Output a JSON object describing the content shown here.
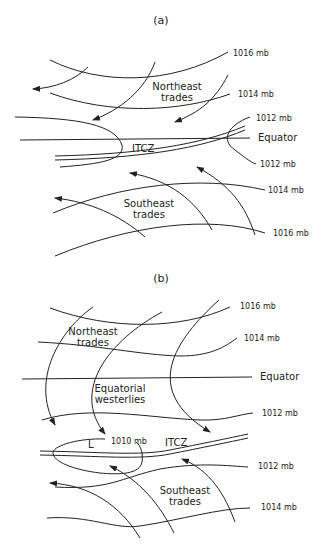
{
  "panel_a": {
    "label": "(a)",
    "isobars": [
      "1016 mb",
      "1014 mb",
      "1012 mb",
      "1012 mb",
      "1014 mb",
      "1016 mb"
    ],
    "equator_label": "Equator",
    "itcz_label": "ITCZ",
    "ne_trades": [
      "Northeast",
      "trades"
    ],
    "se_trades": [
      "Southeast",
      "trades"
    ]
  },
  "panel_b": {
    "label": "(b)",
    "isobars": [
      "1016 mb",
      "1014 mb",
      "1012 mb",
      "1010 mb",
      "1012 mb",
      "1014 mb"
    ],
    "equator_label": "Equator",
    "itcz_label": "ITCZ",
    "low_label": "L",
    "ne_trades": [
      "Northeast",
      "trades"
    ],
    "eq_westerlies": [
      "Equatorial",
      "westerlies"
    ],
    "se_trades": [
      "Southeast",
      "trades"
    ]
  }
}
